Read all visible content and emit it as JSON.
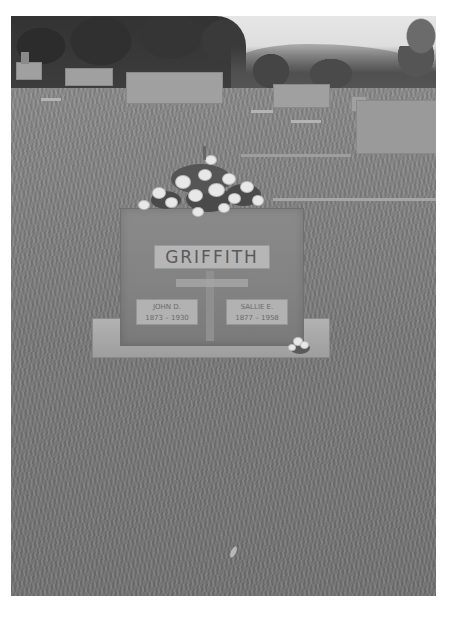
{
  "image": {
    "subject": "Cemetery headstone with floral arrangement",
    "style": "grayscale photograph"
  },
  "headstone": {
    "family_name": "GRIFFITH",
    "left_plate": {
      "name": "JOHN D.",
      "years": "1873 – 1930"
    },
    "right_plate": {
      "name": "SALLIE E.",
      "years": "1877 – 1958"
    }
  },
  "colors": {
    "background": "#ffffff",
    "grass": "#7b7b7b",
    "stone": "#858585",
    "plate": "#b4b4b4",
    "trees": "#333333",
    "sky": "#e0e0e0"
  }
}
